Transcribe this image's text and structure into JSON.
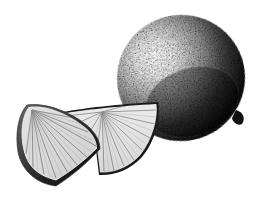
{
  "image": {
    "subject": "Lime with two wedges",
    "style": "black and white stipple etching",
    "background_color": "#ffffff",
    "ink_color": "#111111",
    "objects": [
      {
        "name": "whole-lime",
        "shape": "ellipse",
        "highlight": "upper-left",
        "shadow": "lower-right"
      },
      {
        "name": "lime-wedge-front",
        "position": "left"
      },
      {
        "name": "lime-wedge-back",
        "position": "center"
      }
    ]
  }
}
